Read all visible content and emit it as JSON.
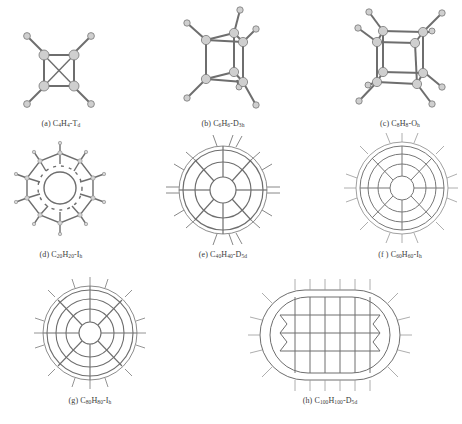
{
  "figure": {
    "type": "molecular-structure-grid",
    "bond_color": "#6e6e6e",
    "atom_fill": "#c8c8c8",
    "atom_stroke": "#7a7a7a",
    "background": "#ffffff",
    "panels": [
      {
        "id": "a",
        "label": "(a)",
        "formula": [
          [
            "C",
            ""
          ],
          [
            "4",
            "sub"
          ],
          [
            "H",
            ""
          ],
          [
            "4",
            "sub"
          ],
          [
            "-T",
            ""
          ],
          [
            "d",
            "sub"
          ]
        ],
        "text": "(a) C4H4-Td",
        "shape": "tetrahedrane"
      },
      {
        "id": "b",
        "label": "(b)",
        "formula": [
          [
            "C",
            ""
          ],
          [
            "6",
            "sub"
          ],
          [
            "H",
            ""
          ],
          [
            "6",
            "sub"
          ],
          [
            "-D",
            ""
          ],
          [
            "3h",
            "sub"
          ]
        ],
        "text": "(b) C6H6-D3h",
        "shape": "prismane"
      },
      {
        "id": "c",
        "label": "(c)",
        "formula": [
          [
            "C",
            ""
          ],
          [
            "8",
            "sub"
          ],
          [
            "H",
            ""
          ],
          [
            "8",
            "sub"
          ],
          [
            "-O",
            ""
          ],
          [
            "h",
            "sub"
          ]
        ],
        "text": "(c) C8H8-Oh",
        "shape": "cubane"
      },
      {
        "id": "d",
        "label": "(d)",
        "formula": [
          [
            "C",
            ""
          ],
          [
            "20",
            "sub"
          ],
          [
            "H",
            ""
          ],
          [
            "20",
            "sub"
          ],
          [
            "-I",
            ""
          ],
          [
            "h",
            "sub"
          ]
        ],
        "text": "(d) C20H20-Ih",
        "shape": "dodecahedrane"
      },
      {
        "id": "e",
        "label": "(e)",
        "formula": [
          [
            "C",
            ""
          ],
          [
            "40",
            "sub"
          ],
          [
            "H",
            ""
          ],
          [
            "40",
            "sub"
          ],
          [
            "-D",
            ""
          ],
          [
            "5d",
            "sub"
          ]
        ],
        "text": "(e) C40H40-D5d",
        "shape": "cage-40"
      },
      {
        "id": "f",
        "label": "(f )",
        "formula": [
          [
            "C",
            ""
          ],
          [
            "60",
            "sub"
          ],
          [
            "H",
            ""
          ],
          [
            "60",
            "sub"
          ],
          [
            "-I",
            ""
          ],
          [
            "h",
            "sub"
          ]
        ],
        "text": "(f ) C60H60-Ih",
        "shape": "cage-60"
      },
      {
        "id": "g",
        "label": "(g)",
        "formula": [
          [
            "C",
            ""
          ],
          [
            "80",
            "sub"
          ],
          [
            "H",
            ""
          ],
          [
            "80",
            "sub"
          ],
          [
            "-I",
            ""
          ],
          [
            "h",
            "sub"
          ]
        ],
        "text": "(g) C80H80-Ih",
        "shape": "cage-80"
      },
      {
        "id": "h",
        "label": "(h)",
        "formula": [
          [
            "C",
            ""
          ],
          [
            "100",
            "sub"
          ],
          [
            "H",
            ""
          ],
          [
            "100",
            "sub"
          ],
          [
            "-D",
            ""
          ],
          [
            "5d",
            "sub"
          ]
        ],
        "text": "(h) C100H100-D5d",
        "shape": "elongated-cage-100"
      }
    ]
  }
}
